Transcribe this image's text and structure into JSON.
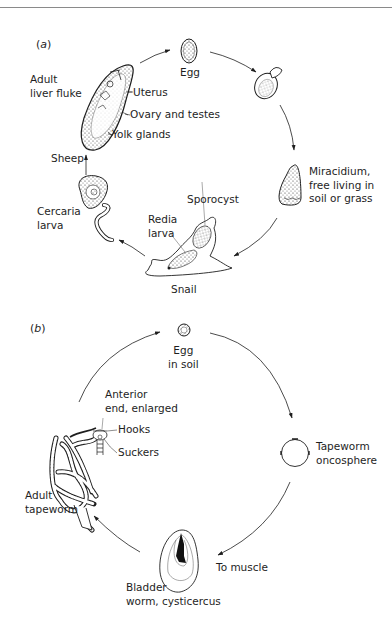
{
  "figure": {
    "panels": [
      {
        "id": "a",
        "label_prefix": "(",
        "label_letter": "a",
        "label_suffix": ")",
        "title": "Liver fluke life cycle",
        "labels": {
          "egg": "Egg",
          "adult": "Adult\nliver fluke",
          "uterus": "Uterus",
          "ovary": "Ovary and testes",
          "yolk": "Yolk glands",
          "sheep": "Sheep",
          "miracidium": "Miracidium,\nfree living in\nsoil or grass",
          "sporocyst": "Sporocyst",
          "redia": "Redia\nlarva",
          "cercaria": "Cercaria\nlarva",
          "snail": "Snail"
        },
        "cycle": [
          "Adult liver fluke",
          "Egg",
          "Hatching egg",
          "Miracidium",
          "Snail (Sporocyst, Redia larva)",
          "Cercaria larva",
          "Sheep"
        ]
      },
      {
        "id": "b",
        "label_prefix": "(",
        "label_letter": "b",
        "label_suffix": ")",
        "title": "Tapeworm life cycle",
        "labels": {
          "egg": "Egg\nin soil",
          "anterior": "Anterior\nend, enlarged",
          "hooks": "Hooks",
          "suckers": "Suckers",
          "adult": "Adult\ntapeworm",
          "oncosphere": "Tapeworm\noncosphere",
          "muscle": "To muscle",
          "bladder": "Bladder\nworm, cysticercus"
        },
        "cycle": [
          "Egg in soil",
          "Tapeworm oncosphere",
          "To muscle",
          "Bladder worm, cysticercus",
          "Adult tapeworm"
        ]
      }
    ],
    "colors": {
      "ink": "#1e1e1e",
      "paper": "#ffffff",
      "rule": "#8a8a8a"
    }
  }
}
